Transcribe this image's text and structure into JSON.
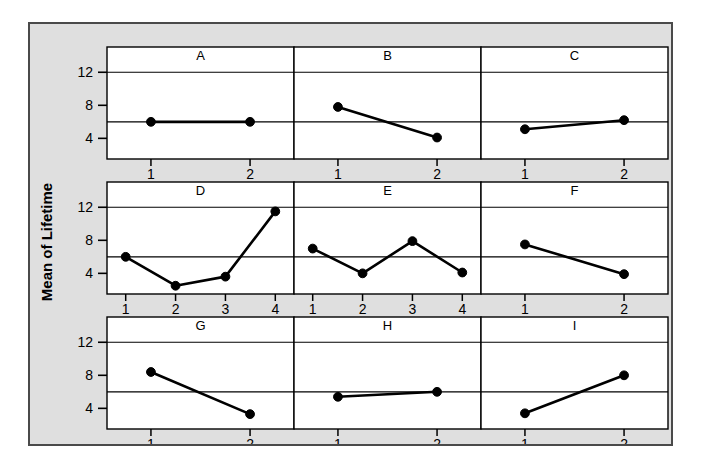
{
  "figure": {
    "background_color": "#dfdfdf",
    "panel_color": "#ffffff",
    "border_color": "#4a4a4a",
    "ink_color": "#000000",
    "ylabel": "Mean of Lifetime"
  },
  "chart_data": {
    "type": "line",
    "title": "",
    "subtitle": "",
    "xlabel": "",
    "ylabel": "Mean of Lifetime",
    "ylim": [
      1.5,
      13.0
    ],
    "yticks": [
      4,
      8,
      12
    ],
    "ytick_labels": [
      "4",
      "8",
      "12"
    ],
    "gridlines_y": [
      6,
      12
    ],
    "grid": true,
    "legend": "none",
    "layout": {
      "rows": 3,
      "cols": 3,
      "shared_y_axis": true,
      "strip_label_position": "top"
    },
    "panels": [
      {
        "label": "A",
        "row": 1,
        "col": 1,
        "x": [
          1,
          2
        ],
        "xtick_labels": [
          "1",
          "2"
        ],
        "values": [
          6.0,
          6.0
        ]
      },
      {
        "label": "B",
        "row": 1,
        "col": 2,
        "x": [
          1,
          2
        ],
        "xtick_labels": [
          "1",
          "2"
        ],
        "values": [
          7.8,
          4.1
        ]
      },
      {
        "label": "C",
        "row": 1,
        "col": 3,
        "x": [
          1,
          2
        ],
        "xtick_labels": [
          "1",
          "2"
        ],
        "values": [
          5.1,
          6.2
        ]
      },
      {
        "label": "D",
        "row": 2,
        "col": 1,
        "x": [
          1,
          2,
          3,
          4
        ],
        "xtick_labels": [
          "1",
          "2",
          "3",
          "4"
        ],
        "values": [
          6.0,
          2.5,
          3.6,
          11.5
        ]
      },
      {
        "label": "E",
        "row": 2,
        "col": 2,
        "x": [
          1,
          2,
          3,
          4
        ],
        "xtick_labels": [
          "1",
          "2",
          "3",
          "4"
        ],
        "values": [
          7.0,
          4.0,
          7.9,
          4.1
        ]
      },
      {
        "label": "F",
        "row": 2,
        "col": 3,
        "x": [
          1,
          2
        ],
        "xtick_labels": [
          "1",
          "2"
        ],
        "values": [
          7.5,
          3.9
        ]
      },
      {
        "label": "G",
        "row": 3,
        "col": 1,
        "x": [
          1,
          2
        ],
        "xtick_labels": [
          "1",
          "2"
        ],
        "values": [
          8.4,
          3.3
        ]
      },
      {
        "label": "H",
        "row": 3,
        "col": 2,
        "x": [
          1,
          2
        ],
        "xtick_labels": [
          "1",
          "2"
        ],
        "values": [
          5.4,
          6.0
        ]
      },
      {
        "label": "I",
        "row": 3,
        "col": 3,
        "x": [
          1,
          2
        ],
        "xtick_labels": [
          "1",
          "2"
        ],
        "values": [
          3.4,
          8.0
        ]
      }
    ]
  }
}
